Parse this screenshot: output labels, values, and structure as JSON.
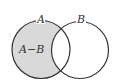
{
  "diagram": {
    "type": "venn",
    "sets": [
      {
        "name": "A",
        "label": "A"
      },
      {
        "name": "B",
        "label": "B"
      }
    ],
    "shaded_region": {
      "label": "A−B"
    },
    "colors": {
      "shade": "#d9d9d9",
      "stroke": "#333333",
      "background": "#ffffff"
    }
  }
}
